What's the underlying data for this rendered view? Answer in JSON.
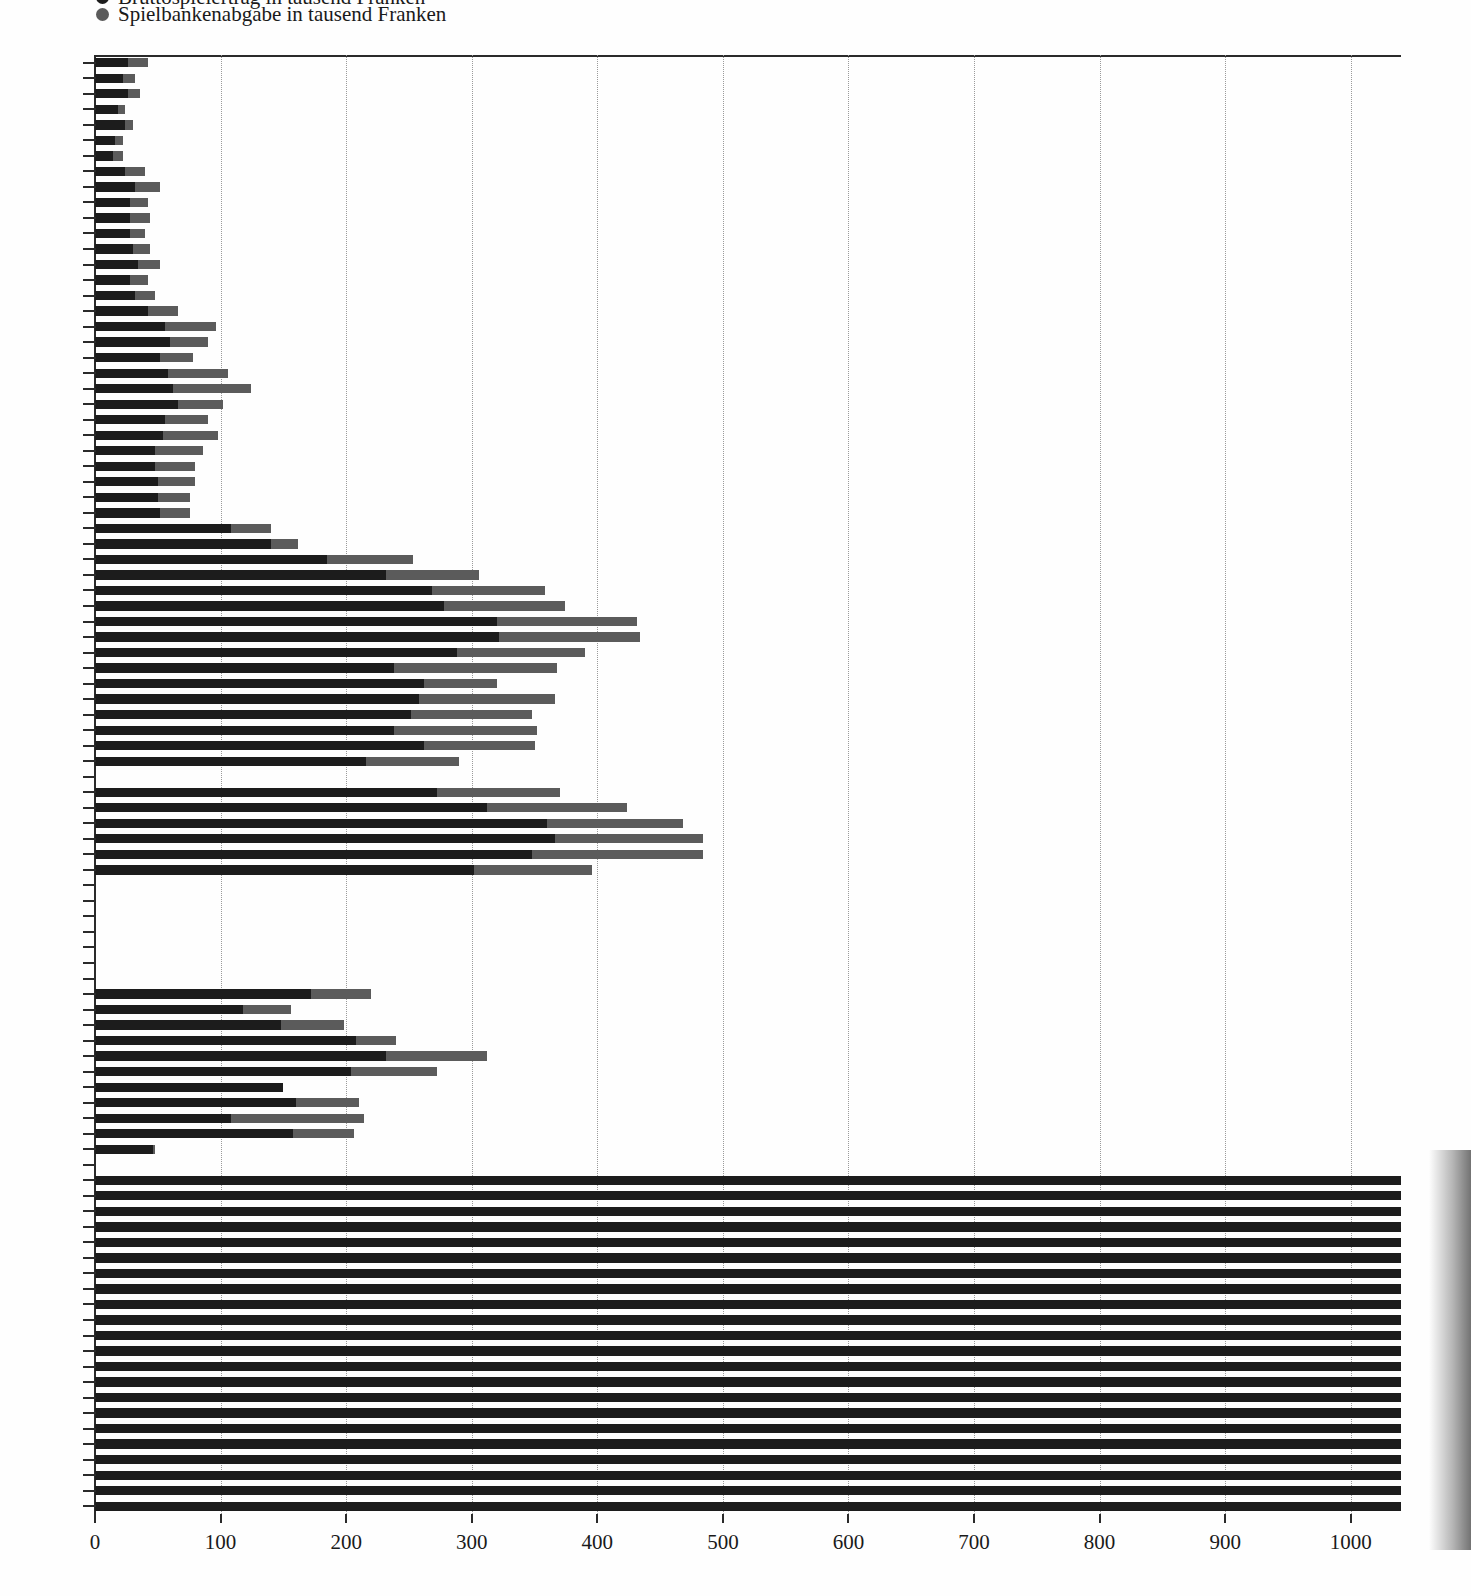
{
  "legend": {
    "cut_off_line": "Bruttospielertrag in tausend Franken",
    "items": [
      {
        "label": "Spielbankenabgabe in tausend Franken",
        "color": "#5b5b5b",
        "marker": "circle-dot-icon"
      }
    ]
  },
  "colors": {
    "series_dark": "#1c1c1c",
    "series_light": "#5b5b5b",
    "axis": "#2a2a2a",
    "grid": "#9a9a9a",
    "background": "#fefefe"
  },
  "chart_data": {
    "type": "bar",
    "orientation": "horizontal",
    "stacked": true,
    "title": "",
    "subtitle": "",
    "xlabel": "",
    "ylabel": "",
    "xlim": [
      0,
      1040
    ],
    "ylim_note": "years 1930 to 2023, one bar per year",
    "grid": true,
    "grid_axis": "x",
    "legend_position": "top-left",
    "xticks": [
      0,
      100,
      200,
      300,
      400,
      500,
      600,
      700,
      800,
      900,
      1000
    ],
    "xtick_labels": [
      "0",
      "100",
      "200",
      "300",
      "400",
      "500",
      "600",
      "700",
      "800",
      "900",
      "1000"
    ],
    "yticks_labeled": [
      "1930",
      "1935",
      "1940",
      "1945",
      "1950",
      "1955",
      "1960",
      "1965",
      "1970",
      "1975",
      "1980",
      "1985",
      "1990",
      "1995",
      "2000",
      "2002",
      "2005",
      "2010",
      "2015",
      "2020",
      "2023"
    ],
    "series": [
      {
        "name": "Bruttospielertrag in tausend Franken",
        "color": "#1c1c1c"
      },
      {
        "name": "Spielbankenabgabe in tausend Franken",
        "color": "#5b5b5b"
      }
    ],
    "categories": [
      "1930",
      "1931",
      "1932",
      "1933",
      "1934",
      "1935",
      "1936",
      "1937",
      "1938",
      "1939",
      "1940",
      "1941",
      "1942",
      "1943",
      "1944",
      "1945",
      "1946",
      "1947",
      "1948",
      "1949",
      "1950",
      "1951",
      "1952",
      "1953",
      "1954",
      "1955",
      "1956",
      "1957",
      "1958",
      "1959",
      "1960",
      "1961",
      "1962",
      "1963",
      "1964",
      "1965",
      "1966",
      "1967",
      "1968",
      "1969",
      "1970",
      "1971",
      "1972",
      "1973",
      "1974",
      "1975",
      "1976",
      "1977",
      "1978",
      "1979",
      "1980",
      "1981",
      "1982",
      "1983",
      "1984",
      "1985",
      "1986",
      "1987",
      "1988",
      "1989",
      "1990",
      "1991",
      "1992",
      "1993",
      "1994",
      "1995",
      "1996",
      "1997",
      "1998",
      "1999",
      "2000",
      "2001",
      "2002",
      "2003",
      "2004",
      "2005",
      "2006",
      "2007",
      "2008",
      "2009",
      "2010",
      "2011",
      "2012",
      "2013",
      "2014",
      "2015",
      "2016",
      "2017",
      "2018",
      "2019",
      "2020",
      "2021",
      "2022",
      "2023"
    ],
    "values_dark": [
      26,
      22,
      26,
      18,
      24,
      16,
      14,
      24,
      32,
      28,
      28,
      28,
      30,
      34,
      28,
      32,
      42,
      56,
      60,
      52,
      58,
      62,
      66,
      56,
      54,
      48,
      48,
      50,
      50,
      52,
      108,
      140,
      185,
      232,
      268,
      278,
      320,
      322,
      288,
      238,
      262,
      258,
      252,
      238,
      262,
      216,
      0,
      272,
      312,
      360,
      366,
      348,
      302,
      0,
      0,
      0,
      0,
      0,
      0,
      0,
      172,
      118,
      148,
      208,
      232,
      204,
      150,
      160,
      108,
      158,
      46,
      0,
      1040,
      1040,
      1040,
      1040,
      1040,
      1040,
      1040,
      1040,
      1040,
      1040,
      1040,
      1040,
      1040,
      1040,
      1040,
      1040,
      1040,
      1040,
      1040,
      1040,
      1040,
      1040
    ],
    "values_light": [
      16,
      10,
      10,
      6,
      6,
      6,
      8,
      16,
      20,
      14,
      16,
      12,
      14,
      18,
      14,
      16,
      24,
      40,
      30,
      26,
      48,
      62,
      36,
      34,
      44,
      38,
      32,
      30,
      26,
      24,
      32,
      22,
      68,
      74,
      90,
      96,
      112,
      112,
      102,
      130,
      58,
      108,
      96,
      114,
      88,
      74,
      0,
      98,
      112,
      108,
      118,
      136,
      94,
      0,
      0,
      0,
      0,
      0,
      0,
      0,
      48,
      38,
      50,
      32,
      80,
      68,
      -10,
      50,
      106,
      48,
      2,
      0,
      0,
      0,
      0,
      0,
      0,
      0,
      0,
      0,
      0,
      0,
      0,
      0,
      0,
      0,
      0,
      0,
      0,
      0,
      0,
      0,
      0,
      0
    ],
    "totals": [
      42,
      32,
      36,
      24,
      30,
      22,
      22,
      40,
      52,
      42,
      44,
      40,
      44,
      52,
      42,
      48,
      66,
      96,
      90,
      78,
      106,
      124,
      102,
      90,
      98,
      86,
      80,
      80,
      76,
      76,
      140,
      162,
      253,
      306,
      358,
      374,
      432,
      434,
      390,
      368,
      320,
      366,
      348,
      352,
      350,
      290,
      0,
      370,
      424,
      468,
      484,
      484,
      396,
      0,
      0,
      0,
      0,
      0,
      0,
      0,
      220,
      156,
      198,
      240,
      312,
      272,
      140,
      210,
      214,
      206,
      48,
      0,
      1040,
      1040,
      1040,
      1040,
      1040,
      1040,
      1040,
      1040,
      1040,
      1040,
      1040,
      1040,
      1040,
      1040,
      1040,
      1040,
      1040,
      1040,
      1040,
      1040,
      1040,
      1040
    ],
    "annotations": [
      "Years 1983-1989 and 2001 have no bars (no data / gambling ban period).",
      "From 2002 onward bars extend beyond the plotted range and are clipped at the right page edge."
    ]
  }
}
